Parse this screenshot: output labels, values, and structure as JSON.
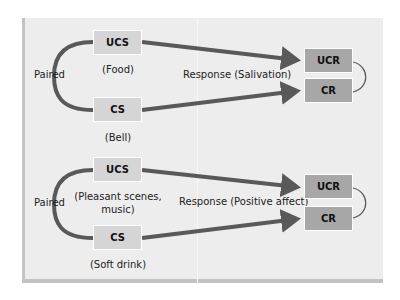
{
  "colors": {
    "panel": "#ededed",
    "stimulus_box": "#d5d5d5",
    "response_box": "#a7a7a7",
    "arrow": "#595959"
  },
  "diagrams": [
    {
      "paired_label": "Paired",
      "ucs": {
        "label": "UCS",
        "caption": "(Food)"
      },
      "cs": {
        "label": "CS",
        "caption": "(Bell)"
      },
      "response_label": "Response (Salivation)",
      "ucr": {
        "label": "UCR"
      },
      "cr": {
        "label": "CR"
      }
    },
    {
      "paired_label": "Paired",
      "ucs": {
        "label": "UCS",
        "caption_line1": "(Pleasant scenes,",
        "caption_line2": "music)"
      },
      "cs": {
        "label": "CS",
        "caption": "(Soft drink)"
      },
      "response_label": "Response (Positive affect)",
      "ucr": {
        "label": "UCR"
      },
      "cr": {
        "label": "CR"
      }
    }
  ]
}
